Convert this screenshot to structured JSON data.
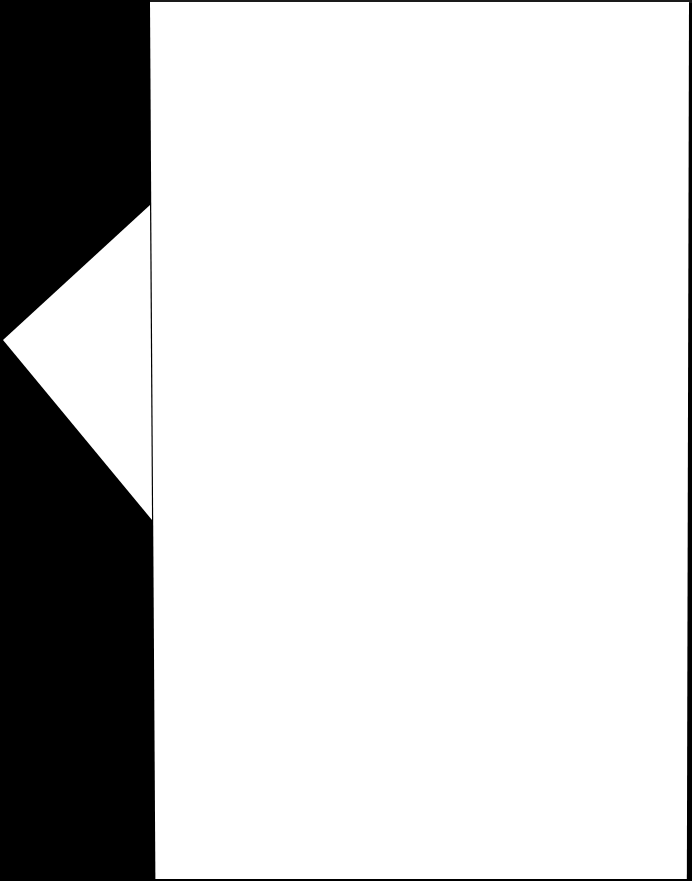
{
  "document": {
    "type": "scanned-page",
    "content": "",
    "page_color": "#ffffff",
    "background_color": "#000000"
  }
}
